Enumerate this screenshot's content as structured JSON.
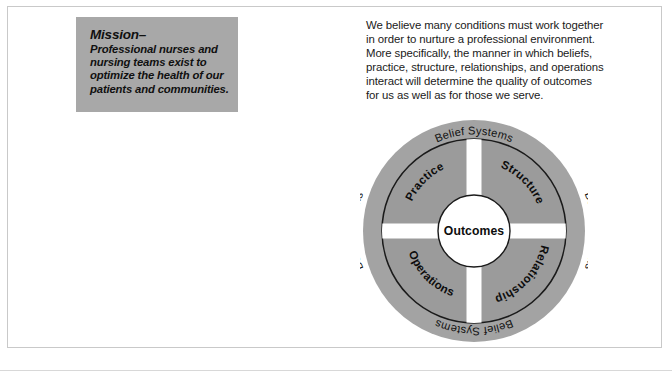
{
  "page": {
    "background_color": "#ffffff",
    "border_color": "#c9c9c9"
  },
  "mission": {
    "title": "Mission–",
    "body": "Professional nurses\nand nursing teams\nexist to optimize the\nhealth of our patients\nand communities.",
    "background_color": "#a8a8a8",
    "text_color": "#101010"
  },
  "intro": {
    "paragraph": "We believe many conditions must work together\nin order to nurture a professional environment.\nMore specifically, the manner in which beliefs,\npractice, structure, relationships, and operations\ninteract will determine the quality of outcomes\nfor us as well as for those we serve."
  },
  "diagram": {
    "name": "belief-systems-outcomes-wheel",
    "center_label": "Outcomes",
    "ring_color": "#a3a3a3",
    "quadrant_color": "#9b9b9b",
    "line_color": "#1a1a1a",
    "center_fill": "#ffffff",
    "ring_labels": [
      {
        "position": "top",
        "text": "Belief Systems"
      },
      {
        "position": "right",
        "text": "Belief Systems"
      },
      {
        "position": "bottom",
        "text": "Belief Systems"
      },
      {
        "position": "left",
        "text": "Belief Systems"
      }
    ],
    "quadrants": [
      {
        "position": "top-left",
        "label": "Practice"
      },
      {
        "position": "top-right",
        "label": "Structure"
      },
      {
        "position": "bottom-right",
        "label": "Relationships"
      },
      {
        "position": "bottom-left",
        "label": "Operations"
      }
    ]
  }
}
